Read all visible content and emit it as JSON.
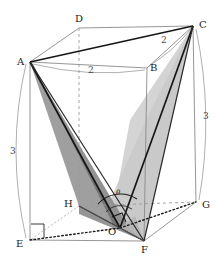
{
  "figure": {
    "kind": "geometry-diagram",
    "colors": {
      "background": "#ffffff",
      "edge_solid": "#7a7a7a",
      "edge_bold": "#1a1a1a",
      "edge_dashed": "#7a7a7a",
      "edge_dotted_bold": "#1a1a1a",
      "shade_dark": "#8f8f8f",
      "shade_mid": "#a8a8a8",
      "shade_light": "#c6c6c6",
      "label_text": "#1a1a1a",
      "measure_text": "#4a4a4a"
    }
  },
  "vertices": [
    {
      "name": "A",
      "label": "A",
      "x": 30,
      "y": 62,
      "label_x": 17,
      "label_y": 57
    },
    {
      "name": "B",
      "label": "B",
      "x": 147,
      "y": 68,
      "label_x": 150,
      "label_y": 63
    },
    {
      "name": "C",
      "label": "C",
      "x": 193,
      "y": 26,
      "label_x": 199,
      "label_y": 20
    },
    {
      "name": "D",
      "label": "D",
      "x": 79,
      "y": 28,
      "label_x": 75,
      "label_y": 14
    },
    {
      "name": "E",
      "label": "E",
      "x": 30,
      "y": 240,
      "label_x": 16,
      "label_y": 239
    },
    {
      "name": "F",
      "label": "F",
      "x": 144,
      "y": 241,
      "label_x": 141,
      "label_y": 245
    },
    {
      "name": "G",
      "label": "G",
      "x": 196,
      "y": 202,
      "label_x": 202,
      "label_y": 200
    },
    {
      "name": "H",
      "label": "H",
      "x": 79,
      "y": 206,
      "label_x": 64,
      "label_y": 199
    },
    {
      "name": "O",
      "label": "O",
      "x": 120,
      "y": 228,
      "label_x": 108,
      "label_y": 227
    }
  ],
  "measures": [
    {
      "name": "ab-length",
      "label": "2",
      "x": 88,
      "y": 66
    },
    {
      "name": "bc-length",
      "label": "2",
      "x": 161,
      "y": 36
    },
    {
      "name": "ae-length",
      "label": "3",
      "x": 10,
      "y": 147
    },
    {
      "name": "cg-length",
      "label": "3",
      "x": 203,
      "y": 112
    }
  ],
  "angles": [
    {
      "name": "theta-angle",
      "label": "θ",
      "x": 116,
      "y": 190
    }
  ],
  "markers": [
    {
      "name": "right-angle-at-e",
      "kind": "right-angle-square"
    },
    {
      "name": "right-angle-at-o",
      "kind": "right-angle-square"
    }
  ]
}
